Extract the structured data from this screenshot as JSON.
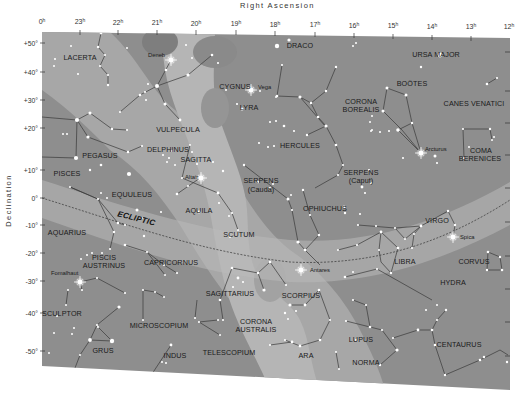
{
  "axes": {
    "x_title": "Right Ascension",
    "y_title": "Declination",
    "ra_ticks": [
      {
        "h": "0",
        "x": 42
      },
      {
        "h": "23",
        "x": 80
      },
      {
        "h": "22",
        "x": 118
      },
      {
        "h": "21",
        "x": 157
      },
      {
        "h": "20",
        "x": 196
      },
      {
        "h": "19",
        "x": 236
      },
      {
        "h": "18",
        "x": 275
      },
      {
        "h": "17",
        "x": 315
      },
      {
        "h": "16",
        "x": 354
      },
      {
        "h": "15",
        "x": 393
      },
      {
        "h": "14",
        "x": 432
      },
      {
        "h": "13",
        "x": 471
      },
      {
        "h": "12",
        "x": 509
      }
    ],
    "ra_unit": "h",
    "dec_ticks": [
      {
        "label": "+50°",
        "y": 43
      },
      {
        "label": "+40°",
        "y": 72
      },
      {
        "label": "+30°",
        "y": 100
      },
      {
        "label": "+20°",
        "y": 128
      },
      {
        "label": "+10°",
        "y": 170
      },
      {
        "label": "0°",
        "y": 198
      },
      {
        "label": "-10°",
        "y": 225
      },
      {
        "label": "-20°",
        "y": 253
      },
      {
        "label": "-30°",
        "y": 281
      },
      {
        "label": "-40°",
        "y": 313
      },
      {
        "label": "-50°",
        "y": 351
      }
    ]
  },
  "constellations": [
    {
      "name": "LACERTA",
      "x": 80,
      "y": 58
    },
    {
      "name": "CYGNUS",
      "x": 235,
      "y": 87
    },
    {
      "name": "DRACO",
      "x": 300,
      "y": 46
    },
    {
      "name": "URSA MAJOR",
      "x": 436,
      "y": 55
    },
    {
      "name": "LYRA",
      "x": 249,
      "y": 108
    },
    {
      "name": "BOÖTES",
      "x": 412,
      "y": 84
    },
    {
      "name": "CORONA",
      "x": 361,
      "y": 102
    },
    {
      "name": "BOREALIS",
      "x": 361,
      "y": 110
    },
    {
      "name": "CANES VENATICI",
      "x": 474,
      "y": 104
    },
    {
      "name": "VULPECULA",
      "x": 178,
      "y": 130
    },
    {
      "name": "DELPHINUS",
      "x": 168,
      "y": 150
    },
    {
      "name": "HERCULES",
      "x": 300,
      "y": 146
    },
    {
      "name": "PEGASUS",
      "x": 100,
      "y": 156
    },
    {
      "name": "SAGITTA",
      "x": 196,
      "y": 160
    },
    {
      "name": "COMA",
      "x": 481,
      "y": 151
    },
    {
      "name": "BERENICES",
      "x": 480,
      "y": 159
    },
    {
      "name": "SERPENS",
      "x": 261,
      "y": 181
    },
    {
      "name": "(Cauda)",
      "x": 261,
      "y": 190
    },
    {
      "name": "SERPENS",
      "x": 361,
      "y": 173
    },
    {
      "name": "(Caput)",
      "x": 361,
      "y": 181
    },
    {
      "name": "PISCES",
      "x": 67,
      "y": 174
    },
    {
      "name": "EQUULEUS",
      "x": 132,
      "y": 195
    },
    {
      "name": "OPHIUCHUS",
      "x": 325,
      "y": 209
    },
    {
      "name": "AQUILA",
      "x": 199,
      "y": 211
    },
    {
      "name": "VIRGO",
      "x": 437,
      "y": 221
    },
    {
      "name": "AQUARIUS",
      "x": 67,
      "y": 233
    },
    {
      "name": "SCUTUM",
      "x": 239,
      "y": 235
    },
    {
      "name": "PISCIS",
      "x": 104,
      "y": 258
    },
    {
      "name": "AUSTRINUS",
      "x": 104,
      "y": 266
    },
    {
      "name": "CAPRICORNUS",
      "x": 171,
      "y": 263
    },
    {
      "name": "LIBRA",
      "x": 405,
      "y": 262
    },
    {
      "name": "CORVUS",
      "x": 474,
      "y": 262
    },
    {
      "name": "SAGITTARIUS",
      "x": 230,
      "y": 294
    },
    {
      "name": "SCORPIUS",
      "x": 301,
      "y": 296
    },
    {
      "name": "HYDRA",
      "x": 453,
      "y": 283
    },
    {
      "name": "SCULPTOR",
      "x": 62,
      "y": 314
    },
    {
      "name": "MICROSCOPIUM",
      "x": 159,
      "y": 326
    },
    {
      "name": "CORONA",
      "x": 256,
      "y": 322
    },
    {
      "name": "AUSTRALIS",
      "x": 256,
      "y": 330
    },
    {
      "name": "LUPUS",
      "x": 361,
      "y": 340
    },
    {
      "name": "CENTAURUS",
      "x": 459,
      "y": 345
    },
    {
      "name": "GRUS",
      "x": 103,
      "y": 351
    },
    {
      "name": "INDUS",
      "x": 175,
      "y": 356
    },
    {
      "name": "TELESCOPIUM",
      "x": 229,
      "y": 353
    },
    {
      "name": "ARA",
      "x": 306,
      "y": 356
    },
    {
      "name": "NORMA",
      "x": 366,
      "y": 363
    }
  ],
  "bright_stars": [
    {
      "name": "Deneb",
      "x": 171,
      "y": 60,
      "label_x": 148,
      "label_y": 52
    },
    {
      "name": "Vega",
      "x": 251,
      "y": 90,
      "label_x": 258,
      "label_y": 84
    },
    {
      "name": "Arcturus",
      "x": 421,
      "y": 153,
      "label_x": 425,
      "label_y": 146
    },
    {
      "name": "Altair",
      "x": 201,
      "y": 178,
      "label_x": 185,
      "label_y": 174
    },
    {
      "name": "Spica",
      "x": 453,
      "y": 237,
      "label_x": 460,
      "label_y": 234
    },
    {
      "name": "Antares",
      "x": 301,
      "y": 270,
      "label_x": 310,
      "label_y": 267
    },
    {
      "name": "Fomalhaut",
      "x": 80,
      "y": 282,
      "label_x": 51,
      "label_y": 270
    }
  ],
  "ecliptic": {
    "label": "ECLIPTIC"
  },
  "colors": {
    "sky": "#8e8e8e",
    "milky_way": "#a9a9a9",
    "milky_way_bright": "#bdbdbd",
    "dark_lane": "#7f7f7f",
    "star": "#ffffff",
    "line": "#3a3a3a"
  }
}
